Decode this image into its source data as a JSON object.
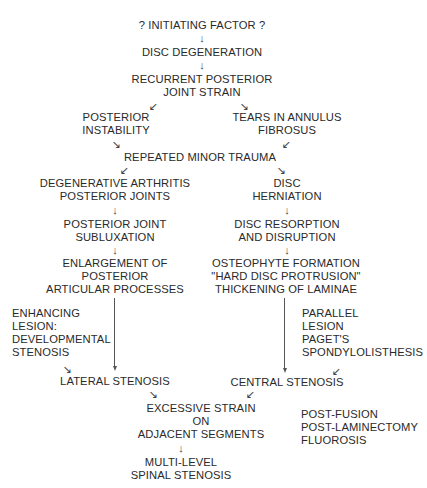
{
  "diagram": {
    "type": "flowchart",
    "nodes": {
      "initiating": [
        "? INITIATING FACTOR ?"
      ],
      "disc_degeneration": [
        "DISC DEGENERATION"
      ],
      "recurrent_strain": [
        "RECURRENT POSTERIOR",
        "JOINT STRAIN"
      ],
      "posterior_instability": [
        "POSTERIOR",
        "INSTABILITY"
      ],
      "tears_annulus": [
        "TEARS IN ANNULUS",
        "FIBROSUS"
      ],
      "repeated_trauma": [
        "REPEATED MINOR TRAUMA"
      ],
      "degenerative_arthritis": [
        "DEGENERATIVE ARTHRITIS",
        "POSTERIOR JOINTS"
      ],
      "disc_herniation": [
        "DISC",
        "HERNIATION"
      ],
      "posterior_subluxation": [
        "POSTERIOR JOINT",
        "SUBLUXATION"
      ],
      "disc_resorption": [
        "DISC RESORPTION",
        "AND DISRUPTION"
      ],
      "enlargement": [
        "ENLARGEMENT OF",
        "POSTERIOR",
        "ARTICULAR PROCESSES"
      ],
      "osteophyte": [
        "OSTEOPHYTE FORMATION",
        "\"HARD DISC PROTRUSION\"",
        "THICKENING OF LAMINAE"
      ],
      "enhancing_lesion": [
        "ENHANCING",
        "LESION:",
        "DEVELOPMENTAL",
        "STENOSIS"
      ],
      "parallel_lesion": [
        "PARALLEL",
        "LESION",
        "PAGET'S",
        "SPONDYLOLISTHESIS"
      ],
      "lateral_stenosis": [
        "LATERAL STENOSIS"
      ],
      "central_stenosis": [
        "CENTRAL STENOSIS"
      ],
      "excessive_strain": [
        "EXCESSIVE STRAIN",
        "ON",
        "ADJACENT SEGMENTS"
      ],
      "post_fusion": [
        "POST-FUSION",
        "POST-LAMINECTOMY",
        "FLUOROSIS"
      ],
      "multilevel": [
        "MULTI-LEVEL",
        "SPINAL STENOSIS"
      ]
    },
    "arrows": {
      "down": "↓",
      "down_left": "↙",
      "down_right": "↘"
    },
    "edges": [
      [
        "initiating",
        "disc_degeneration"
      ],
      [
        "disc_degeneration",
        "recurrent_strain"
      ],
      [
        "recurrent_strain",
        "posterior_instability"
      ],
      [
        "recurrent_strain",
        "tears_annulus"
      ],
      [
        "posterior_instability",
        "repeated_trauma"
      ],
      [
        "tears_annulus",
        "repeated_trauma"
      ],
      [
        "repeated_trauma",
        "degenerative_arthritis"
      ],
      [
        "repeated_trauma",
        "disc_herniation"
      ],
      [
        "degenerative_arthritis",
        "posterior_subluxation"
      ],
      [
        "posterior_subluxation",
        "enlargement"
      ],
      [
        "enlargement",
        "lateral_stenosis"
      ],
      [
        "enhancing_lesion",
        "lateral_stenosis"
      ],
      [
        "disc_herniation",
        "disc_resorption"
      ],
      [
        "disc_resorption",
        "osteophyte"
      ],
      [
        "osteophyte",
        "central_stenosis"
      ],
      [
        "parallel_lesion",
        "central_stenosis"
      ],
      [
        "lateral_stenosis",
        "excessive_strain"
      ],
      [
        "central_stenosis",
        "excessive_strain"
      ],
      [
        "excessive_strain",
        "multilevel"
      ]
    ]
  }
}
